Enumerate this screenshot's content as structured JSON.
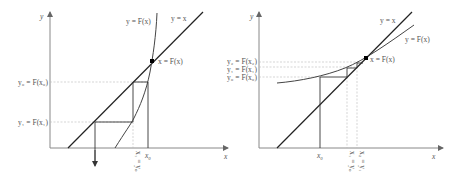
{
  "figure": {
    "panels": [
      {
        "id": "left",
        "title": "Divergent iteration (F steeper than y = x)",
        "axis_x_label": "x",
        "axis_y_label": "y",
        "line_label": "y = x",
        "curve_label": "y = F(x)",
        "fixed_point_label": "x = F(x)",
        "y_tick_labels": [
          "y₀ = F(x₀)",
          "y₁ = F(x₁)"
        ],
        "x_tick_labels": [
          "x₀",
          "x₁ = y₀"
        ]
      },
      {
        "id": "right",
        "title": "Convergent iteration (F flatter than y = x)",
        "axis_x_label": "x",
        "axis_y_label": "y",
        "line_label": "y = x",
        "curve_label": "y = F(x)",
        "fixed_point_label": "x = F(x)",
        "y_tick_labels": [
          "y₂ = F(x₂)",
          "y₁ = F(x₁)",
          "y₀ = F(x₀)"
        ],
        "x_tick_labels": [
          "x₀",
          "x₁ = y₀",
          "x₂ = y₁"
        ]
      }
    ],
    "colors": {
      "axis": "#888888",
      "line": "#222222",
      "curve": "#444444",
      "guide": "#bbbbbb",
      "point": "#000000"
    }
  }
}
